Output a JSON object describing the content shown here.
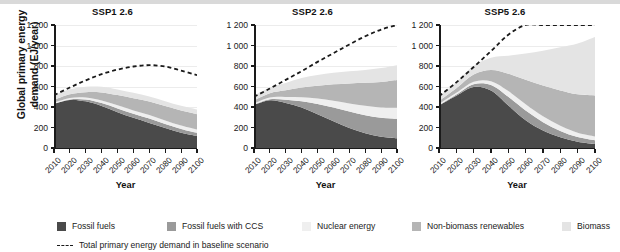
{
  "chart_data": {
    "type": "area",
    "title": "",
    "xlabel": "Year",
    "ylabel": "Global primary energy demand (EJ/year)",
    "ylim": [
      0,
      1200
    ],
    "ytick_labels": [
      "0",
      "200",
      "400",
      "600",
      "800",
      "1 000",
      "1 200"
    ],
    "ytick_values": [
      0,
      200,
      400,
      600,
      800,
      1000,
      1200
    ],
    "x": [
      2010,
      2020,
      2030,
      2040,
      2050,
      2060,
      2070,
      2080,
      2090,
      2100
    ],
    "xtick_labels": [
      "2010",
      "2020",
      "2030",
      "2040",
      "2050",
      "2060",
      "2070",
      "2080",
      "2090",
      "2100"
    ],
    "grid": true,
    "legend_position": "bottom",
    "series_names": [
      "Fossil fuels",
      "Fossil fuels with CCS",
      "Nuclear energy",
      "Non-biomass renewables",
      "Biomass"
    ],
    "series_colors": [
      "#4a4a4a",
      "#9a9a9a",
      "#efefef",
      "#b5b5b5",
      "#e4e4e4"
    ],
    "baseline_name": "Total primary energy demand in baseline scenario",
    "baseline_color": "#1a1a1a",
    "panels": [
      {
        "title": "SSP1 2.6",
        "series": [
          {
            "name": "Fossil fuels",
            "values": [
              430,
              468,
              455,
              410,
              350,
              295,
              245,
              195,
              150,
              118
            ]
          },
          {
            "name": "Fossil fuels with CCS",
            "values": [
              2,
              6,
              18,
              28,
              36,
              40,
              42,
              40,
              36,
              30
            ]
          },
          {
            "name": "Nuclear energy",
            "values": [
              10,
              14,
              20,
              26,
              30,
              32,
              34,
              34,
              33,
              32
            ]
          },
          {
            "name": "Non-biomass renewables",
            "values": [
              28,
              36,
              52,
              78,
              100,
              118,
              132,
              140,
              146,
              150
            ]
          },
          {
            "name": "Biomass",
            "values": [
              45,
              48,
              52,
              55,
              55,
              53,
              50,
              48,
              46,
              45
            ]
          }
        ],
        "baseline": [
          515,
          590,
          660,
          720,
          765,
          795,
          808,
          795,
          755,
          710
        ]
      },
      {
        "title": "SSP2 2.6",
        "series": [
          {
            "name": "Fossil fuels",
            "values": [
              420,
              465,
              440,
              395,
              330,
              260,
              195,
              145,
              110,
              95
            ]
          },
          {
            "name": "Fossil fuels with CCS",
            "values": [
              3,
              10,
              30,
              60,
              100,
              135,
              160,
              175,
              185,
              190
            ]
          },
          {
            "name": "Nuclear energy",
            "values": [
              12,
              18,
              28,
              40,
              52,
              66,
              80,
              92,
              100,
              108
            ]
          },
          {
            "name": "Non-biomass renewables",
            "values": [
              30,
              42,
              65,
              95,
              125,
              160,
              195,
              225,
              250,
              270
            ]
          },
          {
            "name": "Biomass",
            "values": [
              45,
              55,
              72,
              92,
              105,
              112,
              118,
              125,
              135,
              145
            ]
          }
        ],
        "baseline": [
          500,
          580,
          665,
          750,
          840,
          925,
          1010,
          1090,
          1155,
          1215
        ]
      },
      {
        "title": "SSP5 2.6",
        "series": [
          {
            "name": "Fossil fuels",
            "values": [
              415,
              510,
              595,
              560,
              415,
              270,
              170,
              105,
              62,
              40
            ]
          },
          {
            "name": "Fossil fuels with CCS",
            "values": [
              3,
              12,
              28,
              55,
              85,
              95,
              82,
              62,
              45,
              35
            ]
          },
          {
            "name": "Nuclear energy",
            "values": [
              10,
              16,
              24,
              36,
              55,
              62,
              58,
              50,
              42,
              38
            ]
          },
          {
            "name": "Non-biomass renewables",
            "values": [
              30,
              45,
              70,
              110,
              170,
              240,
              300,
              345,
              375,
              400
            ]
          },
          {
            "name": "Biomass",
            "values": [
              45,
              60,
              85,
              120,
              175,
              255,
              340,
              420,
              495,
              570
            ]
          }
        ],
        "baseline": [
          505,
          640,
          790,
          945,
          1105,
          1215,
          1215,
          1215,
          1215,
          1215
        ]
      }
    ]
  },
  "legend": {
    "items": [
      {
        "label": "Fossil fuels",
        "color": "#4a4a4a"
      },
      {
        "label": "Fossil fuels with CCS",
        "color": "#9a9a9a"
      },
      {
        "label": "Nuclear energy",
        "color": "#efefef"
      },
      {
        "label": "Non-biomass renewables",
        "color": "#b5b5b5"
      },
      {
        "label": "Biomass",
        "color": "#e4e4e4"
      }
    ],
    "baseline_label": "Total primary energy demand in baseline scenario"
  }
}
